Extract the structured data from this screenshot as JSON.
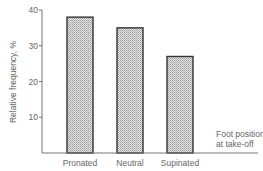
{
  "chart_data": {
    "type": "bar",
    "title": "",
    "xlabel": "Foot position at take-off",
    "xlabel_lines": [
      "Foot position",
      "at take-off"
    ],
    "ylabel": "Relative frequency, %",
    "ylim": [
      0,
      40
    ],
    "yticks": [
      10,
      20,
      30,
      40
    ],
    "ytick_labels": [
      "10",
      "20",
      "30",
      "40"
    ],
    "categories": [
      "Pronated",
      "Neutral",
      "Supinated"
    ],
    "values": [
      38,
      35,
      27
    ],
    "grid": false,
    "legend": null,
    "bar_fill": "dotted-gray",
    "bar_stroke": "#333333"
  }
}
